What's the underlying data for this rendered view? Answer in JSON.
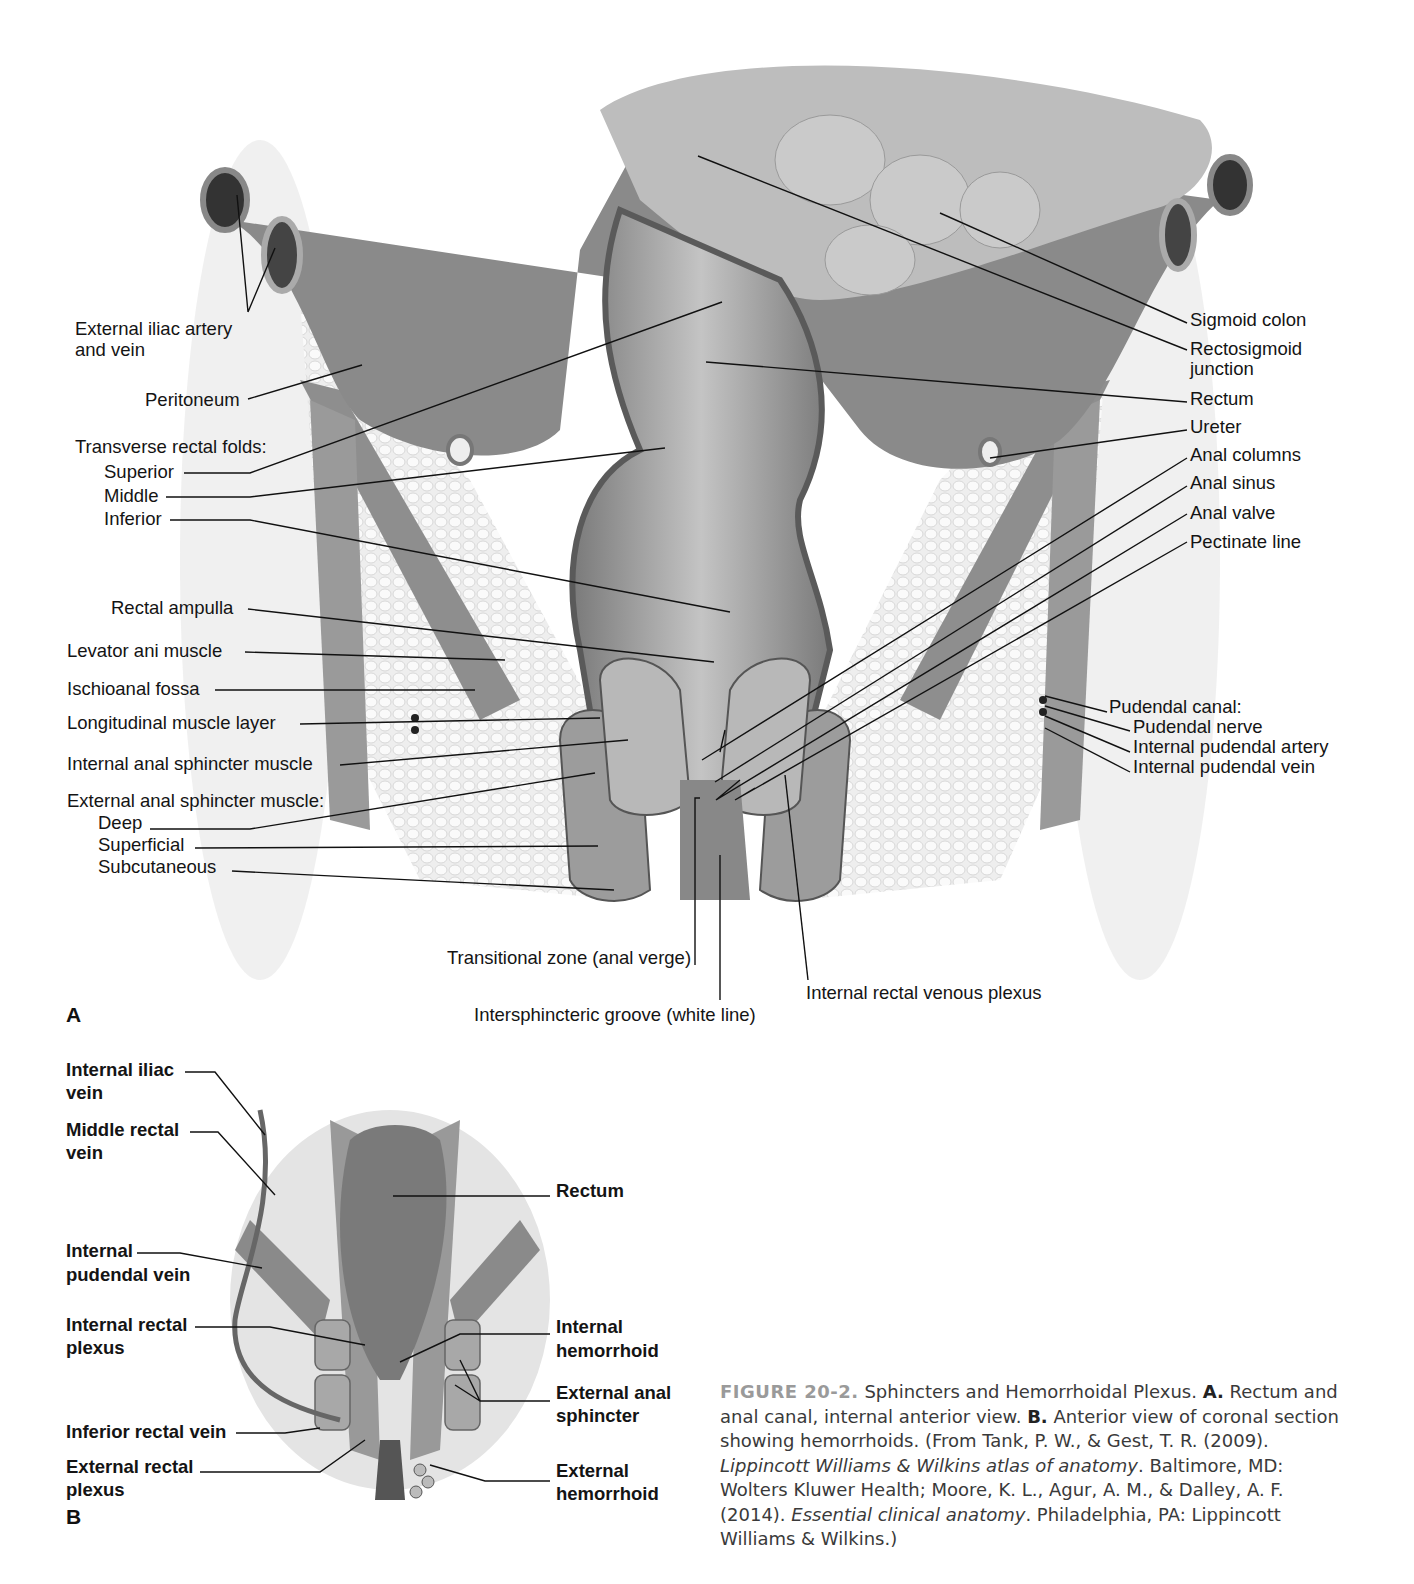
{
  "panel_a": {
    "letter": "A",
    "left_labels": {
      "external_iliac": [
        "External iliac artery",
        "and vein"
      ],
      "peritoneum": "Peritoneum",
      "transverse_rectal_folds": "Transverse rectal folds:",
      "superior": "Superior",
      "middle": "Middle",
      "inferior": "Inferior",
      "rectal_ampulla": "Rectal ampulla",
      "levator_ani": "Levator ani muscle",
      "ischioanal_fossa": "Ischioanal fossa",
      "longitudinal_muscle": "Longitudinal muscle layer",
      "internal_anal_sphincter": "Internal anal sphincter muscle",
      "external_anal_sphincter": "External anal sphincter muscle:",
      "deep": "Deep",
      "superficial": "Superficial",
      "subcutaneous": "Subcutaneous"
    },
    "right_labels": {
      "sigmoid_colon": "Sigmoid colon",
      "rectosigmoid_junction": [
        "Rectosigmoid",
        "junction"
      ],
      "rectum": "Rectum",
      "ureter": "Ureter",
      "anal_columns": "Anal columns",
      "anal_sinus": "Anal sinus",
      "anal_valve": "Anal valve",
      "pectinate_line": "Pectinate line",
      "pudendal_canal": "Pudendal canal:",
      "pudendal_nerve": "Pudendal nerve",
      "internal_pudendal_artery": "Internal pudendal artery",
      "internal_pudendal_vein": "Internal pudendal vein"
    },
    "bottom_labels": {
      "transitional_zone": "Transitional zone (anal verge)",
      "intersphincteric_groove": "Intersphincteric groove (white line)",
      "internal_rectal_venous_plexus": "Internal rectal venous plexus"
    }
  },
  "panel_b": {
    "letter": "B",
    "left_labels": {
      "internal_iliac_vein": [
        "Internal iliac",
        "vein"
      ],
      "middle_rectal_vein": [
        "Middle rectal",
        "vein"
      ],
      "internal_pudendal_vein": [
        "Internal",
        "pudendal vein"
      ],
      "internal_rectal_plexus": [
        "Internal rectal",
        "plexus"
      ],
      "inferior_rectal_vein": "Inferior rectal vein",
      "external_rectal_plexus": [
        "External rectal",
        "plexus"
      ]
    },
    "right_labels": {
      "rectum": "Rectum",
      "internal_hemorrhoid": [
        "Internal",
        "hemorrhoid"
      ],
      "external_anal_sphincter": [
        "External anal",
        "sphincter"
      ],
      "external_hemorrhoid": [
        "External",
        "hemorrhoid"
      ]
    }
  },
  "caption": {
    "figure_number": "FIGURE 20-2.",
    "title": " Sphincters and Hemorrhoidal Plexus. ",
    "a_marker": "A.",
    "a_text": " Rectum and anal canal, internal anterior view. ",
    "b_marker": "B.",
    "b_text": " Anterior view of coronal section showing hemorrhoids. (From Tank, P. W., & Gest, T. R. (2009). ",
    "book1": "Lippincott Williams & Wilkins atlas of anatomy",
    "ref1_rest": ". Baltimore, MD: Wolters Kluwer Health; Moore, K. L., Agur, A. M., & Dalley, A. F. (2014). ",
    "book2": "Essential clinical anatomy",
    "ref2_rest": ". Philadelphia, PA: Lippincott Williams & Wilkins.)"
  }
}
